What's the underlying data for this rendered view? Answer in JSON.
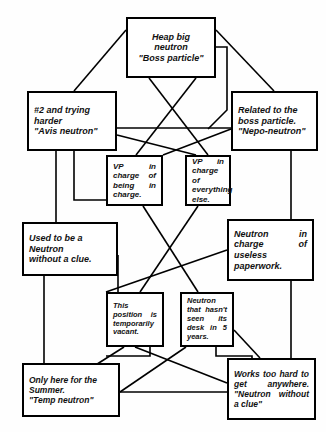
{
  "chart_data": {
    "type": "diagram",
    "subtitle": "",
    "layout": "hierarchical org chart with crossing connector lines",
    "nodes": [
      {
        "id": "boss",
        "label": "Heap big\nneutron\n\"Boss particle\"",
        "x": 126,
        "y": 17,
        "w": 90,
        "h": 61,
        "align": "center",
        "size": "f9"
      },
      {
        "id": "avis",
        "label": "#2 and trying\nharder\n\"Avis neutron\"",
        "x": 27,
        "y": 91,
        "w": 90,
        "h": 60,
        "align": "left",
        "size": "f9"
      },
      {
        "id": "nepo",
        "label": "Related to the\nboss particle.\n\"Nepo-neutron\"",
        "x": 231,
        "y": 91,
        "w": 87,
        "h": 60,
        "align": "left",
        "size": "f9"
      },
      {
        "id": "vp-charge",
        "label": "VP in charge of being in charge.",
        "x": 106,
        "y": 155,
        "w": 57,
        "h": 51,
        "align": "just",
        "size": "f8"
      },
      {
        "id": "vp-everything",
        "label": "VP in charge of everything else.",
        "x": 185,
        "y": 155,
        "w": 46,
        "h": 51,
        "align": "just",
        "size": "f8"
      },
      {
        "id": "clueless",
        "label": "Used to be a\nNeutron\nwithout a clue.",
        "x": 22,
        "y": 222,
        "w": 96,
        "h": 54,
        "align": "left",
        "size": "f9"
      },
      {
        "id": "paperwork",
        "label": "Neutron in charge of useless paperwork.",
        "x": 227,
        "y": 219,
        "w": 87,
        "h": 62,
        "align": "just",
        "size": "f9"
      },
      {
        "id": "vacant",
        "label": "This position is temporarily vacant.",
        "x": 106,
        "y": 292,
        "w": 58,
        "h": 55,
        "align": "just",
        "size": "f75"
      },
      {
        "id": "nodesk",
        "label": "Neutron that hasn't seen its desk in 5 years.",
        "x": 180,
        "y": 292,
        "w": 54,
        "h": 55,
        "align": "just",
        "size": "f75"
      },
      {
        "id": "temp",
        "label": "Only here for the\nSummer.\n\"Temp    neutron\"",
        "x": 22,
        "y": 363,
        "w": 98,
        "h": 54,
        "align": "left",
        "size": "f85"
      },
      {
        "id": "overworked",
        "label": "Works too hard to get anywhere. \"Neutron without a clue\"",
        "x": 227,
        "y": 358,
        "w": 89,
        "h": 62,
        "align": "just",
        "size": "f85"
      }
    ],
    "connections": [
      {
        "from": "boss",
        "to": "avis",
        "path": "M126,30 L74,91"
      },
      {
        "from": "boss",
        "to": "nepo",
        "path": "M216,30 L274,91"
      },
      {
        "from": "boss",
        "to": "vp-everything",
        "path": "M149,78 L208,155"
      },
      {
        "from": "boss",
        "to": "vp-charge",
        "path": "M196,78 L136,155"
      },
      {
        "from": "boss",
        "to": "right-spine",
        "path": "M216,47 L227,47 L227,110 L208,129"
      },
      {
        "from": "avis",
        "to": "nepo-cross",
        "path": "M117,128 L231,128"
      },
      {
        "from": "avis",
        "to": "vp-right",
        "path": "M117,135 L196,155"
      },
      {
        "from": "nepo",
        "to": "vp-left",
        "path": "M231,129 L163,155"
      },
      {
        "from": "avis",
        "to": "clueless-spine",
        "path": "M56,151 L56,222"
      },
      {
        "from": "avis",
        "to": "vacant-spine",
        "path": "M74,151 L74,200 L106,200"
      },
      {
        "from": "nepo",
        "to": "paperwork-spine",
        "path": "M291,151 L291,219"
      },
      {
        "from": "vp-charge",
        "to": "nodesk",
        "path": "M143,206 L198,292"
      },
      {
        "from": "vp-everything",
        "to": "vacant",
        "path": "M198,206 L140,292"
      },
      {
        "from": "paperwork",
        "to": "vacant-branch",
        "path": "M227,250 L106,292"
      },
      {
        "from": "clueless",
        "to": "temp",
        "path": "M44,276 L44,363"
      },
      {
        "from": "clueless",
        "to": "vacant-left",
        "path": "M118,255 L118,292"
      },
      {
        "from": "paperwork",
        "to": "overworked",
        "path": "M291,281 L291,358"
      },
      {
        "from": "vacant",
        "to": "temp",
        "path": "M124,347 L72,380"
      },
      {
        "from": "vacant",
        "to": "overworked-a",
        "path": "M135,347 L227,383"
      },
      {
        "from": "nodesk",
        "to": "temp-b",
        "path": "M186,347 L120,392"
      },
      {
        "from": "nodesk",
        "to": "overworked-b",
        "path": "M234,330 L260,358"
      },
      {
        "from": "temp",
        "to": "overworked-line",
        "path": "M120,392 L227,392"
      },
      {
        "from": "vacant",
        "to": "bottom-hook",
        "path": "M150,347 L150,356 L106,356"
      },
      {
        "from": "nodesk",
        "to": "bottom-hook2",
        "path": "M216,347 L216,356 L252,356 L252,358"
      }
    ]
  }
}
